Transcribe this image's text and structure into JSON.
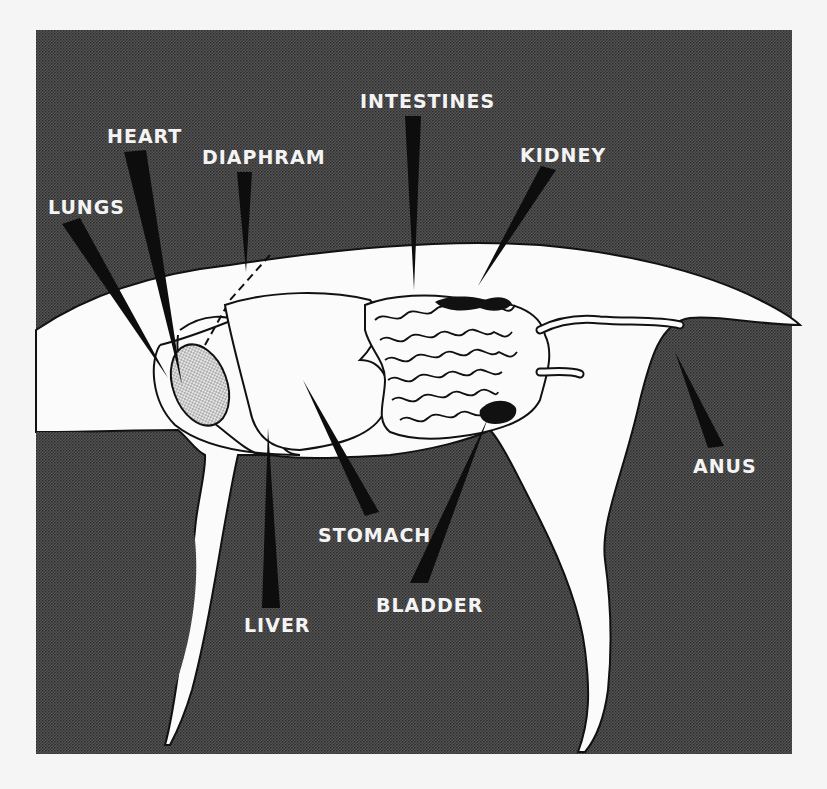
{
  "diagram": {
    "colors": {
      "background_panel": "#4a4a4a",
      "body_fill": "#fbfbfb",
      "outline": "#111111",
      "pointer": "#0d0d0d",
      "label_text": "#f4f4f4",
      "page": "#f5f5f5"
    },
    "labels": {
      "lungs": "LUNGS",
      "heart": "HEART",
      "diaphram": "DIAPHRAM",
      "intestines": "INTESTINES",
      "kidney": "KIDNEY",
      "anus": "ANUS",
      "stomach": "STOMACH",
      "bladder": "BLADDER",
      "liver": "LIVER"
    }
  }
}
